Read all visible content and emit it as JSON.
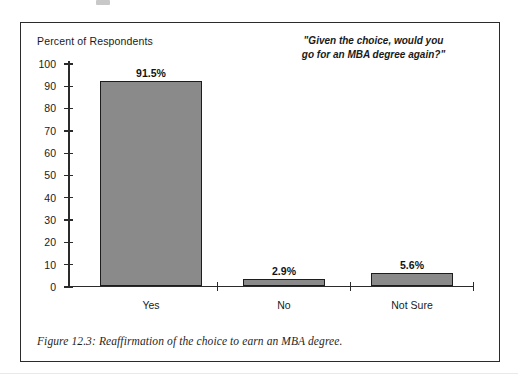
{
  "figure": {
    "caption": "Figure 12.3: Reaffirmation of the choice to earn an MBA degree.",
    "quote_line_1": "\"Given the choice, would you",
    "quote_line_2": "go for an MBA degree again?\"",
    "frame_color": "#2b2b2b"
  },
  "chart_data": {
    "type": "bar",
    "title": "",
    "subtitle": "\"Given the choice, would you go for an MBA degree again?\"",
    "categories": [
      "Yes",
      "No",
      "Not Sure"
    ],
    "values": [
      91.5,
      2.9,
      5.6
    ],
    "data_labels": [
      "91.5%",
      "2.9%",
      "5.6%"
    ],
    "xlabel": "",
    "ylabel": "Percent of Respondents",
    "ylim": [
      0,
      100
    ],
    "yticks": [
      0,
      10,
      20,
      30,
      40,
      50,
      60,
      70,
      80,
      90,
      100
    ],
    "ytick_labels": [
      "0",
      "10",
      "20",
      "30",
      "40",
      "50",
      "60",
      "70",
      "80",
      "90",
      "100"
    ],
    "grid": false,
    "legend": null,
    "bar_fill_color": "#8a8a8a",
    "bar_edge_color": "#1d1d1d",
    "axis_color": "#2b2b2b"
  }
}
